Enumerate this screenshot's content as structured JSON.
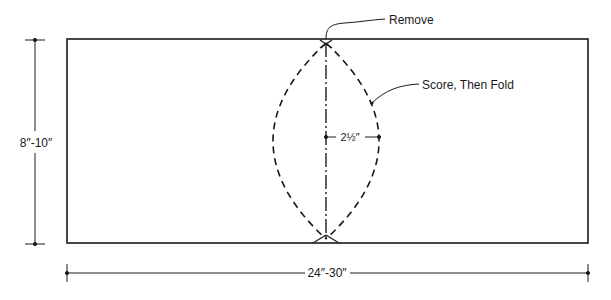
{
  "diagram": {
    "labels": {
      "remove": "Remove",
      "score_fold": "Score, Then Fold",
      "half_width": "2½″",
      "height": "8″-10″",
      "width": "24″-30″"
    },
    "colors": {
      "line": "#1a1a1a",
      "background": "#ffffff"
    }
  }
}
